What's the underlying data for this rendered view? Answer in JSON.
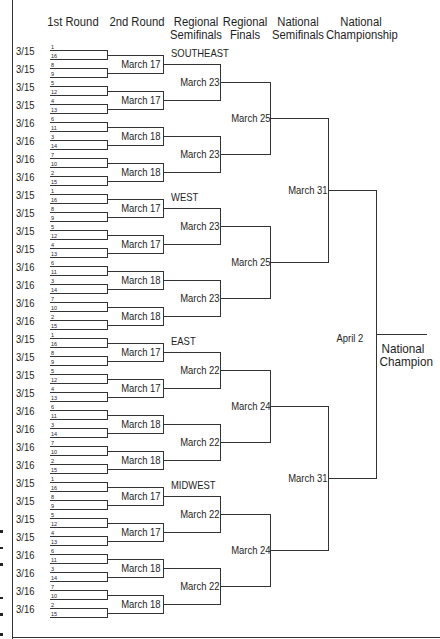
{
  "headers": {
    "round1": "1st Round",
    "round2": "2nd Round",
    "regional_semis_1": "Regional",
    "regional_semis_2": "Semifinals",
    "regional_finals_1": "Regional",
    "regional_finals_2": "Finals",
    "national_semis_1": "National",
    "national_semis_2": "Semifinals",
    "championship_1": "National",
    "championship_2": "Championship"
  },
  "regions": [
    {
      "name": "SOUTHEAST",
      "first_round_dates": [
        "3/15",
        "3/15",
        "3/15",
        "3/15",
        "3/16",
        "3/16",
        "3/16",
        "3/16"
      ],
      "seeds": [
        [
          "1",
          "16"
        ],
        [
          "8",
          "9"
        ],
        [
          "5",
          "12"
        ],
        [
          "4",
          "13"
        ],
        [
          "6",
          "11"
        ],
        [
          "3",
          "14"
        ],
        [
          "7",
          "10"
        ],
        [
          "2",
          "15"
        ]
      ],
      "second_round": [
        "March 17",
        "March 17",
        "March 18",
        "March 18"
      ],
      "regional_semis": [
        "March 23",
        "March 23"
      ],
      "regional_final": "March 25"
    },
    {
      "name": "WEST",
      "first_round_dates": [
        "3/15",
        "3/15",
        "3/15",
        "3/15",
        "3/16",
        "3/16",
        "3/16",
        "3/16"
      ],
      "seeds": [
        [
          "1",
          "16"
        ],
        [
          "8",
          "9"
        ],
        [
          "5",
          "12"
        ],
        [
          "4",
          "13"
        ],
        [
          "6",
          "11"
        ],
        [
          "3",
          "14"
        ],
        [
          "7",
          "10"
        ],
        [
          "2",
          "15"
        ]
      ],
      "second_round": [
        "March 17",
        "March 17",
        "March 18",
        "March 18"
      ],
      "regional_semis": [
        "March 23",
        "March 23"
      ],
      "regional_final": "March 25"
    },
    {
      "name": "EAST",
      "first_round_dates": [
        "3/15",
        "3/15",
        "3/15",
        "3/15",
        "3/16",
        "3/16",
        "3/16",
        "3/16"
      ],
      "seeds": [
        [
          "1",
          "16"
        ],
        [
          "8",
          "9"
        ],
        [
          "5",
          "12"
        ],
        [
          "4",
          "13"
        ],
        [
          "6",
          "11"
        ],
        [
          "3",
          "14"
        ],
        [
          "7",
          "10"
        ],
        [
          "2",
          "15"
        ]
      ],
      "second_round": [
        "March 17",
        "March 17",
        "March 18",
        "March 18"
      ],
      "regional_semis": [
        "March 22",
        "March 22"
      ],
      "regional_final": "March 24"
    },
    {
      "name": "MIDWEST",
      "first_round_dates": [
        "3/15",
        "3/15",
        "3/15",
        "3/15",
        "3/16",
        "3/16",
        "3/16",
        "3/16"
      ],
      "seeds": [
        [
          "1",
          "16"
        ],
        [
          "8",
          "9"
        ],
        [
          "5",
          "12"
        ],
        [
          "4",
          "13"
        ],
        [
          "6",
          "11"
        ],
        [
          "3",
          "14"
        ],
        [
          "7",
          "10"
        ],
        [
          "2",
          "15"
        ]
      ],
      "second_round": [
        "March 17",
        "March 17",
        "March 18",
        "March 18"
      ],
      "regional_semis": [
        "March 22",
        "March 22"
      ],
      "regional_final": "March 24"
    }
  ],
  "national_semis": [
    "March 31",
    "March 31"
  ],
  "championship": "April 2",
  "champion_label_1": "National",
  "champion_label_2": "Champion"
}
